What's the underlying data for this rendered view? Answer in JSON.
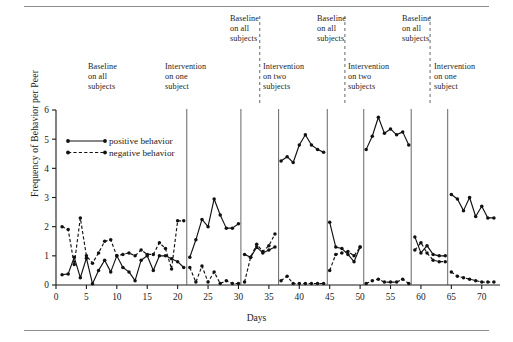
{
  "figure": {
    "has_top_rule": true,
    "has_bottom_rule": true
  },
  "chart_data": {
    "type": "line",
    "title": "",
    "xlabel": "Days",
    "ylabel": "Frequency of Behavior per Peer",
    "xlim": [
      0,
      73
    ],
    "ylim": [
      0,
      6
    ],
    "xticks": [
      0,
      5,
      10,
      15,
      20,
      25,
      30,
      35,
      40,
      45,
      50,
      55,
      60,
      65,
      70
    ],
    "yticks": [
      0,
      1,
      2,
      3,
      4,
      5,
      6
    ],
    "grid": false,
    "legend_position": "upper-left-inside",
    "legend": [
      {
        "name": "positive behavior",
        "style": "solid",
        "marker": "filled-circle"
      },
      {
        "name": "negative behavior",
        "style": "dashed",
        "marker": "filled-circle"
      }
    ],
    "series": [
      {
        "name": "positive behavior",
        "style": "solid",
        "segments": [
          {
            "x": [
              1,
              2,
              3,
              4,
              5,
              6,
              7,
              8,
              9,
              10,
              11,
              12,
              13,
              14,
              15,
              16,
              17,
              18,
              19,
              20,
              21
            ],
            "y": [
              0.35,
              0.38,
              0.95,
              0.25,
              0.92,
              0.04,
              0.5,
              0.85,
              0.45,
              1.0,
              0.6,
              0.45,
              0.15,
              0.85,
              1.0,
              0.5,
              1.0,
              1.0,
              0.9,
              0.8,
              0.6
            ]
          },
          {
            "x": [
              22,
              23,
              24,
              25,
              26,
              27,
              28,
              29,
              30
            ],
            "y": [
              0.95,
              1.55,
              2.25,
              2.0,
              2.95,
              2.4,
              1.95,
              1.95,
              2.1
            ]
          },
          {
            "x": [
              31,
              32,
              33,
              34,
              35,
              36
            ],
            "y": [
              1.05,
              0.95,
              1.3,
              1.1,
              1.2,
              1.3
            ]
          },
          {
            "x": [
              37,
              38,
              39,
              40,
              41,
              42,
              43,
              44
            ],
            "y": [
              4.25,
              4.4,
              4.2,
              4.8,
              5.15,
              4.8,
              4.65,
              4.55
            ]
          },
          {
            "x": [
              45,
              46,
              47,
              48,
              49,
              50
            ],
            "y": [
              2.15,
              1.3,
              1.25,
              1.05,
              0.8,
              1.3
            ]
          },
          {
            "x": [
              51,
              52,
              53,
              54,
              55,
              56,
              57,
              58
            ],
            "y": [
              4.65,
              5.1,
              5.75,
              5.2,
              5.35,
              5.15,
              5.25,
              4.8
            ]
          },
          {
            "x": [
              59,
              60,
              61,
              62,
              63,
              64
            ],
            "y": [
              1.65,
              1.1,
              1.35,
              1.05,
              1.0,
              1.0
            ]
          },
          {
            "x": [
              65,
              66,
              67,
              68,
              69,
              70,
              71,
              72
            ],
            "y": [
              3.1,
              2.95,
              2.55,
              3.0,
              2.35,
              2.7,
              2.3,
              2.3
            ]
          }
        ]
      },
      {
        "name": "negative behavior",
        "style": "dashed",
        "segments": [
          {
            "x": [
              1,
              2,
              3,
              4,
              5,
              6,
              7,
              8,
              9,
              10,
              11,
              12,
              13,
              14,
              15,
              16,
              17,
              18,
              19,
              20,
              21
            ],
            "y": [
              2.0,
              1.9,
              0.7,
              2.3,
              1.0,
              0.75,
              1.1,
              1.5,
              1.55,
              1.0,
              1.05,
              1.1,
              1.0,
              1.2,
              1.05,
              1.05,
              1.45,
              1.25,
              0.55,
              2.2,
              2.2
            ]
          },
          {
            "x": [
              22,
              23,
              24,
              25,
              26,
              27,
              28,
              29,
              30
            ],
            "y": [
              0.6,
              0.1,
              0.65,
              0.1,
              0.45,
              0.05,
              0.15,
              0.05,
              0.05
            ]
          },
          {
            "x": [
              31,
              32,
              33,
              34,
              35,
              36
            ],
            "y": [
              0.1,
              0.95,
              1.4,
              1.15,
              1.35,
              1.75
            ]
          },
          {
            "x": [
              37,
              38,
              39,
              40,
              41,
              42,
              43,
              44
            ],
            "y": [
              0.15,
              0.3,
              0.05,
              0.05,
              0.05,
              0.05,
              0.05,
              0.05
            ]
          },
          {
            "x": [
              45,
              46,
              47,
              48,
              49,
              50
            ],
            "y": [
              0.5,
              1.05,
              1.1,
              1.15,
              1.0,
              1.3
            ]
          },
          {
            "x": [
              51,
              52,
              53,
              54,
              55,
              56,
              57,
              58
            ],
            "y": [
              0.05,
              0.15,
              0.2,
              0.1,
              0.1,
              0.1,
              0.2,
              0.05
            ]
          },
          {
            "x": [
              59,
              60,
              61,
              62,
              63,
              64
            ],
            "y": [
              1.2,
              1.45,
              1.1,
              0.85,
              0.8,
              0.8
            ]
          },
          {
            "x": [
              65,
              66,
              67,
              68,
              69,
              70,
              71,
              72
            ],
            "y": [
              0.45,
              0.3,
              0.25,
              0.2,
              0.15,
              0.1,
              0.1,
              0.1
            ]
          }
        ]
      }
    ],
    "phase_dividers_solid": [
      21.5,
      30.4,
      36.6,
      44.6,
      50.6,
      58.4,
      64.4
    ],
    "phase_dividers_dashed": [
      33.5,
      47.5,
      61.5
    ],
    "phase_labels": [
      {
        "text": "Baseline\non all\nsubjects",
        "x_px": 88,
        "y_px": 62
      },
      {
        "text": "Intervention\non one\nsubject",
        "x_px": 165,
        "y_px": 62
      },
      {
        "text": "Baseline\non all\nsubjects",
        "x_px": 230,
        "y_px": 14
      },
      {
        "text": "Intervention\non two\nsubjects",
        "x_px": 263,
        "y_px": 62
      },
      {
        "text": "Baseline\non all\nsubjects",
        "x_px": 317,
        "y_px": 14
      },
      {
        "text": "Intervention\non two\nsubjects",
        "x_px": 348,
        "y_px": 62
      },
      {
        "text": "Baseline\non all\nsubjects",
        "x_px": 402,
        "y_px": 14
      },
      {
        "text": "Intervention\non one\nsubject",
        "x_px": 434,
        "y_px": 62
      }
    ],
    "colors": {
      "line": "#111111",
      "axis": "#1a1a1a",
      "divider": "#555555",
      "rule": "#8d8d8d"
    }
  }
}
